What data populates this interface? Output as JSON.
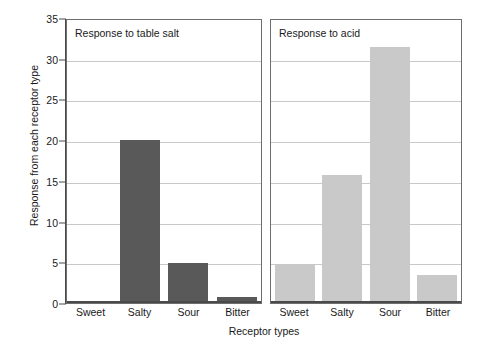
{
  "chart_data": {
    "type": "bar",
    "title": "",
    "xlabel": "Receptor types",
    "ylabel": "Response from each receptor type",
    "categories": [
      "Sweet",
      "Salty",
      "Sour",
      "Bitter"
    ],
    "ylim": [
      0,
      35
    ],
    "yticks": [
      0,
      5,
      10,
      15,
      20,
      25,
      30,
      35
    ],
    "ytick_labels": [
      "0",
      "5",
      "10",
      "15",
      "20",
      "25",
      "30",
      "35"
    ],
    "grid": true,
    "legend": "none",
    "panels": [
      {
        "title": "Response to table salt",
        "bar_color": "#595959",
        "categories": [
          "Sweet",
          "Salty",
          "Sour",
          "Bitter"
        ],
        "values": [
          0,
          20,
          4.9,
          0.7
        ]
      },
      {
        "title": "Response to acid",
        "bar_color": "#c9c9c9",
        "categories": [
          "Sweet",
          "Salty",
          "Sour",
          "Bitter"
        ],
        "values": [
          4.7,
          15.7,
          31.5,
          3.4
        ]
      }
    ]
  },
  "colors": {
    "bar_dark": "#595959",
    "bar_light": "#c9c9c9",
    "gridline": "#c9c9c9",
    "axis": "#4a4a4a",
    "panel_border": "#6e6e6e",
    "background": "#ffffff"
  }
}
